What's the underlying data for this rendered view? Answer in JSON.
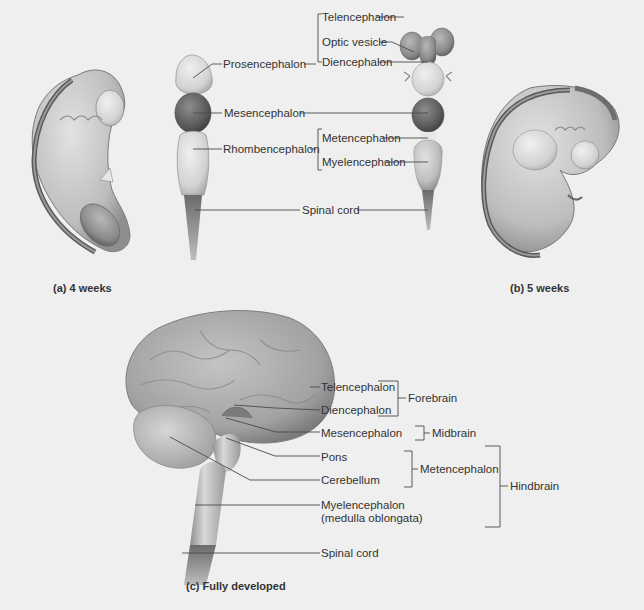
{
  "figure": {
    "panels": [
      {
        "id": "a",
        "caption": "(a)  4 weeks"
      },
      {
        "id": "b",
        "caption": "(b)  5 weeks"
      },
      {
        "id": "c",
        "caption": "(c)  Fully developed"
      }
    ]
  },
  "stage_4weeks": {
    "labels": {
      "prosencephalon": "Prosencephalon",
      "mesencephalon": "Mesencephalon",
      "rhombencephalon": "Rhombencephalon",
      "spinal_cord": "Spinal cord"
    }
  },
  "stage_5weeks": {
    "labels": {
      "telencephalon": "Telencephalon",
      "optic_vesicle": "Optic vesicle",
      "diencephalon": "Diencephalon",
      "metencephalon": "Metencephalon",
      "myelencephalon": "Myelencephalon"
    }
  },
  "adult": {
    "labels": {
      "telencephalon": "Telencephalon",
      "diencephalon": "Diencephalon",
      "mesencephalon": "Mesencephalon",
      "pons": "Pons",
      "cerebellum": "Cerebellum",
      "myelencephalon": "Myelencephalon",
      "myelencephalon_sub": "(medulla oblongata)",
      "spinal_cord": "Spinal cord"
    },
    "groups": {
      "forebrain": "Forebrain",
      "midbrain": "Midbrain",
      "metencephalon": "Metencephalon",
      "hindbrain": "Hindbrain"
    }
  },
  "colors": {
    "background": "#efefef",
    "leader_line": "#4a4a4a",
    "tissue_light": "#c9c9c9",
    "tissue_mid": "#9d9d9d",
    "tissue_dark": "#5e5e5e"
  }
}
